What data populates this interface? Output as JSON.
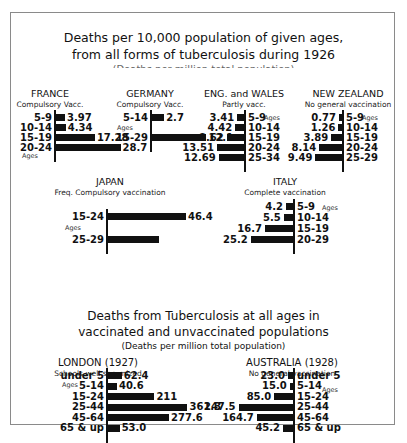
{
  "frame": {
    "border_color": "#8a8a8a"
  },
  "section1": {
    "title_line1": "Deaths per 10,000 population of given ages,",
    "title_line2": "from all forms of tuberculosis during 1926",
    "clipped_subtitle": "(Deaths per million total population)"
  },
  "section2": {
    "title_line1": "Deaths from Tuberculosis at all ages in",
    "title_line2": "vaccinated and unvaccinated populations",
    "subtitle": "(Deaths per million total population)"
  },
  "ages_label": "Ages",
  "chart_data": [
    {
      "type": "bar",
      "orientation": "horizontal",
      "title": "FRANCE",
      "subtitle": "Compulsory Vacc.",
      "categories": [
        "5-9",
        "10-14",
        "15-19",
        "20-24"
      ],
      "values": [
        3.97,
        4.34,
        17.28,
        28.7
      ],
      "value_labels": [
        "3.97",
        "4.34",
        "17.28",
        "28.7"
      ],
      "unit": "deaths per 10,000",
      "direction": "right"
    },
    {
      "type": "bar",
      "orientation": "horizontal",
      "title": "GERMANY",
      "subtitle": "Compulsory Vacc.",
      "categories": [
        "5-14",
        "15-29"
      ],
      "values": [
        2.7,
        12.1
      ],
      "value_labels": [
        "2.7",
        "12.1"
      ],
      "unit": "deaths per 10,000",
      "direction": "right"
    },
    {
      "type": "bar",
      "orientation": "horizontal",
      "title": "ENG. and WALES",
      "subtitle": "Partly vacc.",
      "categories": [
        "5-9",
        "10-14",
        "15-19",
        "20-24",
        "25-34"
      ],
      "values": [
        3.41,
        4.42,
        8.62,
        13.51,
        12.69
      ],
      "value_labels": [
        "3.41",
        "4.42",
        "8.62",
        "13.51",
        "12.69"
      ],
      "unit": "deaths per 10,000",
      "direction": "left"
    },
    {
      "type": "bar",
      "orientation": "horizontal",
      "title": "NEW ZEALAND",
      "subtitle": "No general vaccination",
      "categories": [
        "5-9",
        "10-14",
        "15-19",
        "20-24",
        "25-29"
      ],
      "values": [
        0.77,
        1.26,
        3.89,
        8.14,
        9.49
      ],
      "value_labels": [
        "0.77",
        "1.26",
        "3.89",
        "8.14",
        "9.49"
      ],
      "unit": "deaths per 10,000",
      "direction": "left"
    },
    {
      "type": "bar",
      "orientation": "horizontal",
      "title": "JAPAN",
      "subtitle": "Freq. Compulsory vaccination",
      "categories": [
        "15-24",
        "25-29"
      ],
      "values": [
        46.4,
        30.5
      ],
      "value_labels": [
        "46.4",
        ""
      ],
      "unit": "deaths per 10,000",
      "direction": "right"
    },
    {
      "type": "bar",
      "orientation": "horizontal",
      "title": "ITALY",
      "subtitle": "Complete vaccination",
      "categories": [
        "5-9",
        "10-14",
        "15-19",
        "20-29"
      ],
      "values": [
        4.2,
        5.5,
        16.7,
        25.2
      ],
      "value_labels": [
        "4.2",
        "5.5",
        "16.7",
        "25.2"
      ],
      "unit": "deaths per 10,000",
      "direction": "left"
    },
    {
      "type": "bar",
      "orientation": "horizontal",
      "title": "LONDON (1927)",
      "subtitle": "Schools well serumized",
      "categories": [
        "under 5",
        "5-14",
        "15-24",
        "25-44",
        "45-64",
        "65 & up"
      ],
      "values": [
        62.4,
        40.6,
        211,
        361.3,
        277.6,
        53.0
      ],
      "value_labels": [
        "62.4",
        "40.6",
        "211",
        "361.3",
        "277.6",
        "53.0"
      ],
      "unit": "deaths per million",
      "direction": "right"
    },
    {
      "type": "bar",
      "orientation": "horizontal",
      "title": "AUSTRALIA (1928)",
      "subtitle": "No general vaccination",
      "categories": [
        "under 5",
        "5-14",
        "15-24",
        "25-44",
        "45-64",
        "65 & up"
      ],
      "values": [
        23.0,
        15.0,
        85.0,
        247.5,
        164.7,
        45.2
      ],
      "value_labels": [
        "23.0",
        "15.0",
        "85.0",
        "247.5",
        "164.7",
        "45.2"
      ],
      "unit": "deaths per million",
      "direction": "left"
    }
  ]
}
